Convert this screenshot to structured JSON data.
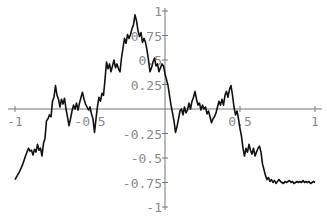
{
  "chart_data": {
    "type": "line",
    "title": "",
    "xlabel": "",
    "ylabel": "",
    "xlim": [
      -1,
      1
    ],
    "ylim": [
      -1,
      1
    ],
    "grid": false,
    "legend": null,
    "x_ticks": [
      {
        "value": -1,
        "label": "-1"
      },
      {
        "value": -0.5,
        "label": "-0.5"
      },
      {
        "value": 0.5,
        "label": "0.5"
      },
      {
        "value": 1,
        "label": "1"
      }
    ],
    "y_ticks": [
      {
        "value": 1,
        "label": "1"
      },
      {
        "value": 0.75,
        "label": "0.75"
      },
      {
        "value": 0.5,
        "label": "0.5"
      },
      {
        "value": 0.25,
        "label": "0.25"
      },
      {
        "value": -0.25,
        "label": "-0.25"
      },
      {
        "value": -0.5,
        "label": "-0.5"
      },
      {
        "value": -0.75,
        "label": "-0.75"
      },
      {
        "value": -1,
        "label": "-1"
      }
    ],
    "series": [
      {
        "name": "fractal curve",
        "color": "#111111",
        "x": [
          -1.0,
          -0.97,
          -0.95,
          -0.93,
          -0.91,
          -0.9,
          -0.89,
          -0.88,
          -0.87,
          -0.86,
          -0.85,
          -0.84,
          -0.83,
          -0.82,
          -0.81,
          -0.8,
          -0.79,
          -0.78,
          -0.77,
          -0.76,
          -0.75,
          -0.74,
          -0.73,
          -0.72,
          -0.71,
          -0.7,
          -0.69,
          -0.68,
          -0.67,
          -0.66,
          -0.65,
          -0.64,
          -0.63,
          -0.62,
          -0.61,
          -0.6,
          -0.59,
          -0.58,
          -0.57,
          -0.56,
          -0.55,
          -0.54,
          -0.53,
          -0.52,
          -0.51,
          -0.5,
          -0.49,
          -0.48,
          -0.47,
          -0.46,
          -0.45,
          -0.44,
          -0.43,
          -0.42,
          -0.41,
          -0.4,
          -0.39,
          -0.38,
          -0.37,
          -0.36,
          -0.35,
          -0.34,
          -0.33,
          -0.32,
          -0.31,
          -0.3,
          -0.29,
          -0.28,
          -0.27,
          -0.26,
          -0.25,
          -0.24,
          -0.23,
          -0.22,
          -0.21,
          -0.2,
          -0.19,
          -0.18,
          -0.17,
          -0.16,
          -0.15,
          -0.14,
          -0.13,
          -0.12,
          -0.11,
          -0.1,
          -0.09,
          -0.08,
          -0.07,
          -0.06,
          -0.05,
          -0.04,
          -0.03,
          -0.02,
          -0.01,
          0.0,
          0.01,
          0.02,
          0.03,
          0.04,
          0.05,
          0.06,
          0.07,
          0.08,
          0.09,
          0.1,
          0.11,
          0.12,
          0.13,
          0.14,
          0.15,
          0.16,
          0.17,
          0.18,
          0.19,
          0.2,
          0.21,
          0.22,
          0.23,
          0.24,
          0.25,
          0.26,
          0.27,
          0.28,
          0.29,
          0.3,
          0.31,
          0.32,
          0.33,
          0.34,
          0.35,
          0.36,
          0.37,
          0.38,
          0.39,
          0.4,
          0.41,
          0.42,
          0.43,
          0.44,
          0.45,
          0.46,
          0.47,
          0.48,
          0.49,
          0.5,
          0.51,
          0.52,
          0.53,
          0.54,
          0.55,
          0.56,
          0.57,
          0.58,
          0.59,
          0.6,
          0.61,
          0.62,
          0.63,
          0.64,
          0.65,
          0.66,
          0.67,
          0.68,
          0.69,
          0.7,
          0.71,
          0.72,
          0.73,
          0.74,
          0.75,
          0.76,
          0.77,
          0.78,
          0.79,
          0.8,
          0.81,
          0.82,
          0.83,
          0.84,
          0.85,
          0.86,
          0.87,
          0.88,
          0.89,
          0.9,
          0.91,
          0.92,
          0.93,
          0.94,
          0.95,
          0.96,
          0.97,
          0.98,
          0.99,
          1.0
        ],
        "y": [
          -0.72,
          -0.64,
          -0.57,
          -0.48,
          -0.4,
          -0.43,
          -0.42,
          -0.47,
          -0.41,
          -0.44,
          -0.36,
          -0.42,
          -0.4,
          -0.48,
          -0.35,
          -0.3,
          -0.12,
          -0.1,
          -0.06,
          -0.08,
          0.08,
          0.12,
          0.24,
          0.14,
          0.1,
          0.02,
          0.1,
          0.05,
          0.11,
          0.0,
          -0.08,
          -0.17,
          -0.1,
          -0.02,
          0.04,
          0.0,
          0.06,
          -0.01,
          0.06,
          0.12,
          0.17,
          0.1,
          0.05,
          0.02,
          -0.01,
          0.02,
          -0.05,
          -0.1,
          -0.24,
          -0.1,
          0.03,
          0.12,
          0.08,
          0.16,
          0.14,
          0.3,
          0.48,
          0.41,
          0.46,
          0.38,
          0.44,
          0.5,
          0.42,
          0.46,
          0.41,
          0.38,
          0.52,
          0.62,
          0.72,
          0.67,
          0.76,
          0.72,
          0.76,
          0.82,
          0.86,
          0.96,
          0.9,
          0.8,
          0.74,
          0.78,
          0.68,
          0.72,
          0.68,
          0.6,
          0.5,
          0.38,
          0.42,
          0.48,
          0.52,
          0.44,
          0.46,
          0.38,
          0.42,
          0.46,
          0.44,
          0.36,
          0.3,
          0.24,
          0.14,
          0.04,
          -0.04,
          -0.12,
          -0.24,
          -0.18,
          -0.1,
          -0.02,
          0.0,
          -0.06,
          0.02,
          -0.04,
          -0.01,
          0.06,
          0.0,
          0.08,
          0.12,
          0.18,
          0.1,
          0.04,
          0.06,
          -0.01,
          0.04,
          0.0,
          0.02,
          -0.05,
          -0.02,
          -0.08,
          -0.14,
          -0.1,
          -0.08,
          -0.04,
          0.02,
          0.08,
          0.04,
          0.1,
          0.04,
          0.14,
          0.18,
          0.12,
          0.2,
          0.24,
          0.14,
          0.02,
          -0.06,
          -0.02,
          -0.1,
          -0.2,
          -0.28,
          -0.4,
          -0.48,
          -0.4,
          -0.44,
          -0.36,
          -0.42,
          -0.46,
          -0.4,
          -0.48,
          -0.44,
          -0.4,
          -0.38,
          -0.44,
          -0.56,
          -0.62,
          -0.68,
          -0.72,
          -0.7,
          -0.74,
          -0.72,
          -0.75,
          -0.73,
          -0.76,
          -0.74,
          -0.72,
          -0.74,
          -0.75,
          -0.76,
          -0.74,
          -0.75,
          -0.74,
          -0.73,
          -0.75,
          -0.74,
          -0.76,
          -0.75,
          -0.74,
          -0.75,
          -0.74,
          -0.75,
          -0.73,
          -0.75,
          -0.74,
          -0.75,
          -0.74,
          -0.76,
          -0.75,
          -0.74,
          -0.75
        ]
      }
    ]
  }
}
